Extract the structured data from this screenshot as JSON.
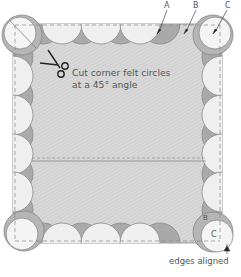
{
  "diagram": {
    "caption_line1": "Cut corner felt circles",
    "caption_line2": "at a 45° angle",
    "label_a": "A",
    "label_b": "B",
    "label_c": "C",
    "label_b_bottom": "B",
    "label_c_bottom": "C",
    "label_edges": "edges aligned",
    "icons": [
      "scissors-icon",
      "arrow-icon"
    ],
    "colors": {
      "fabric": "#d6d6d6",
      "circle_light": "#efefef",
      "circle_dark": "#a9a9a9",
      "outline": "#888888",
      "text": "#555555"
    }
  }
}
